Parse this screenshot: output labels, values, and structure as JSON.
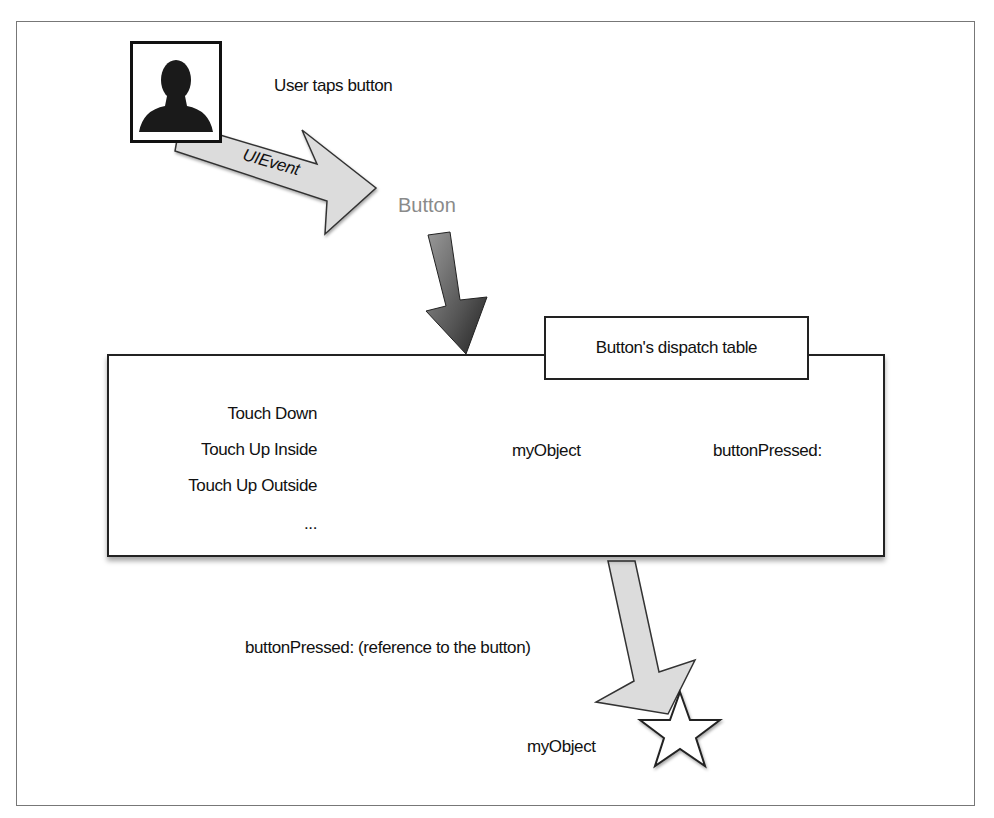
{
  "diagram": {
    "nodes": {
      "user": {
        "icon": "user-silhouette-icon",
        "caption": "User taps button"
      },
      "event_arrow_label": "UIEvent",
      "button": {
        "label": "Button"
      },
      "dispatch_table": {
        "title": "Button's dispatch table",
        "events": [
          "Touch Down",
          "Touch Up Inside",
          "Touch Up Outside",
          "..."
        ],
        "target": "myObject",
        "action": "buttonPressed:"
      },
      "message": "buttonPressed: (reference to the button)",
      "receiver": {
        "label": "myObject",
        "icon": "star-icon"
      }
    },
    "colors": {
      "border": "#222222",
      "light_arrow": "#d9d9d9",
      "dark_arrow": "#555555",
      "button_text": "#8a8a8a"
    }
  }
}
